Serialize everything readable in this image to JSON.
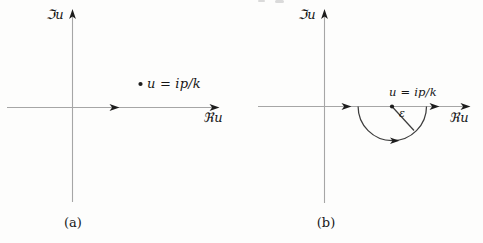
{
  "figure": {
    "colors": {
      "background": "#fdfdfc",
      "axis_line": "#a6a6a6",
      "contour_line": "#3d3d3d",
      "arrow_fill": "#1d1d1d",
      "text": "#161616"
    },
    "panels": {
      "a": {
        "caption": "(a)",
        "imag_axis_label": "ℑu",
        "real_axis_label": "ℜu",
        "pole_label": "u = ip/k"
      },
      "b": {
        "caption": "(b)",
        "imag_axis_label": "ℑu",
        "real_axis_label": "ℜu",
        "pole_label": "u = ip/k",
        "contour_radius_label": "ε"
      }
    }
  }
}
